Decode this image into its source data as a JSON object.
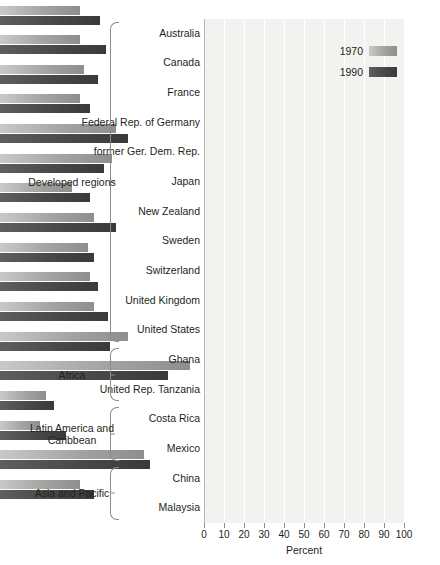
{
  "chart_data": {
    "type": "bar",
    "orientation": "horizontal",
    "title": "",
    "xlabel": "Percent",
    "ylabel": "",
    "xlim": [
      0,
      100
    ],
    "xticks": [
      0,
      10,
      20,
      30,
      40,
      50,
      60,
      70,
      80,
      90,
      100
    ],
    "grid": true,
    "legend_position": "top-right",
    "legend": [
      "1970",
      "1990"
    ],
    "series": [
      {
        "name": "1970",
        "color": "#a3a3a1",
        "values": [
          40,
          40,
          42,
          40,
          58,
          56,
          36,
          47,
          44,
          45,
          47,
          64,
          95,
          23,
          20,
          72,
          40
        ]
      },
      {
        "name": "1990",
        "color": "#484848",
        "values": [
          50,
          53,
          49,
          45,
          64,
          52,
          45,
          58,
          47,
          49,
          54,
          55,
          84,
          27,
          33,
          75,
          47
        ]
      }
    ],
    "categories": [
      "Australia",
      "Canada",
      "France",
      "Federal Rep. of Germany",
      "former Ger. Dem. Rep.",
      "Japan",
      "New Zealand",
      "Sweden",
      "Switzerland",
      "United Kingdom",
      "United States",
      "Ghana",
      "United Rep. Tanzania",
      "Costa Rica",
      "Mexico",
      "China",
      "Malaysia"
    ],
    "groups": [
      {
        "name": "Developed regions",
        "start": 0,
        "end": 10
      },
      {
        "name": "Africa",
        "start": 11,
        "end": 12
      },
      {
        "name": "Latin America and Caribbean",
        "start": 13,
        "end": 14
      },
      {
        "name": "Asia and Pacific",
        "start": 15,
        "end": 16
      }
    ]
  },
  "colors": {
    "plot_background": "#f2f2f0",
    "gridline": "#ffffff",
    "axis": "#8d8b89",
    "text": "#231f20",
    "series_1970": "#a3a3a1",
    "series_1990": "#484848"
  }
}
